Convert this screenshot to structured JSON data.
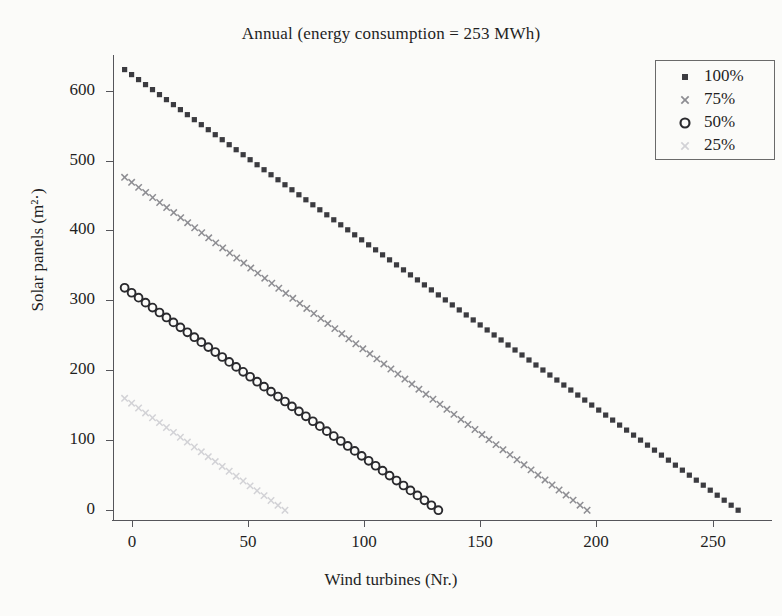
{
  "chart_data": {
    "type": "scatter",
    "title": "Annual (energy consumption = 253 MWh)",
    "xlabel": "Wind turbines (Nr.)",
    "ylabel": "Solar panels (m²·)",
    "xlim": [
      -8,
      276
    ],
    "ylim": [
      -14,
      648
    ],
    "xticks": [
      0,
      50,
      100,
      150,
      200,
      250
    ],
    "yticks": [
      0,
      100,
      200,
      300,
      400,
      500,
      600
    ],
    "grid": false,
    "legend_position": "top-right",
    "legend_entries": [
      "100%",
      "75%",
      "50%",
      "25%"
    ],
    "series": [
      {
        "name": "100%",
        "marker": "square",
        "color": "#3b3b40",
        "x_start": -3,
        "x_end": 261,
        "y_start": 630,
        "y_end": 0,
        "n_points": 89,
        "description": "Linear trade-off line from (−3, 630) to (261, 0)"
      },
      {
        "name": "75%",
        "marker": "cross",
        "color": "#8d8d92",
        "x_start": -3,
        "x_end": 196,
        "y_start": 476,
        "y_end": 0,
        "n_points": 67,
        "description": "Linear trade-off line from (−3, 476) to (196, 0)"
      },
      {
        "name": "50%",
        "marker": "circle",
        "color": "#2a2a2e",
        "x_start": -3,
        "x_end": 132,
        "y_start": 318,
        "y_end": 0,
        "n_points": 46,
        "description": "Linear trade-off line from (−3, 318) to (132, 0)"
      },
      {
        "name": "25%",
        "marker": "cross",
        "color": "#d2d2d6",
        "x_start": -3,
        "x_end": 66,
        "y_start": 160,
        "y_end": 0,
        "n_points": 24,
        "description": "Linear trade-off line from (−3, 160) to (66, 0)"
      }
    ]
  },
  "figure": {
    "title": "Annual (energy consumption = 253 MWh)",
    "xlabel": "Wind turbines (Nr.)",
    "ylabel": "Solar panels (m²·)"
  },
  "legend": {
    "items": [
      {
        "label": "100%",
        "marker": "square-marker-icon"
      },
      {
        "label": "75%",
        "marker": "cross-marker-icon"
      },
      {
        "label": "50%",
        "marker": "circle-marker-icon"
      },
      {
        "label": "25%",
        "marker": "cross-marker-icon"
      }
    ]
  },
  "axes": {
    "x_tick_labels": [
      "0",
      "50",
      "100",
      "150",
      "200",
      "250"
    ],
    "y_tick_labels": [
      "0",
      "100",
      "200",
      "300",
      "400",
      "500",
      "600"
    ]
  }
}
